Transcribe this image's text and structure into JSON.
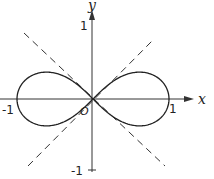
{
  "diagram": {
    "curve": "r^2 = cos(2θ)",
    "axes": {
      "x_label": "x",
      "y_label": "y",
      "origin_label": "O",
      "x_ticks": [
        "-1",
        "1"
      ],
      "y_ticks": [
        "1",
        "-1"
      ]
    },
    "asymptote_lines": [
      "y = x",
      "y = -x"
    ],
    "colors": {
      "ink": "#222222",
      "background": "#ffffff"
    }
  }
}
